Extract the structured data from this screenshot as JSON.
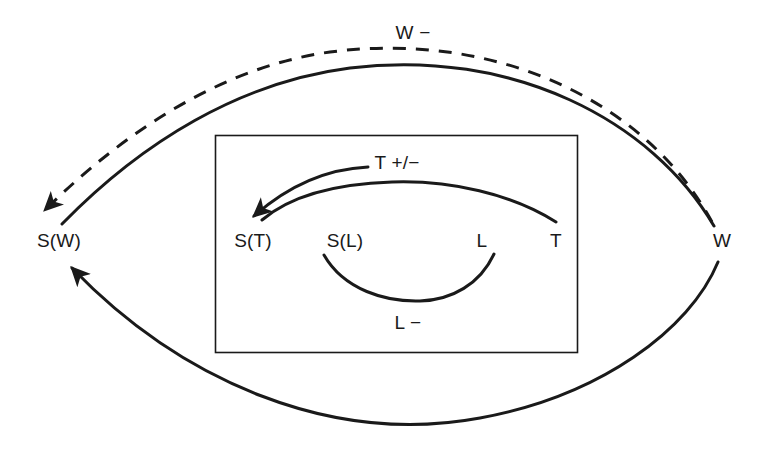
{
  "diagram": {
    "type": "causal-loop-diagram",
    "background_color": "#ffffff",
    "stroke_color": "#1a1a1a",
    "text_color": "#1a1a1a",
    "nodes": [
      {
        "id": "SW",
        "label": "S(W)",
        "x": 59,
        "y": 240,
        "region": "outer-left"
      },
      {
        "id": "W",
        "label": "W",
        "x": 722,
        "y": 240,
        "region": "outer-right"
      },
      {
        "id": "ST",
        "label": "S(T)",
        "x": 253,
        "y": 240,
        "region": "inner"
      },
      {
        "id": "SL",
        "label": "S(L)",
        "x": 345,
        "y": 240,
        "region": "inner"
      },
      {
        "id": "L",
        "label": "L",
        "x": 482,
        "y": 240,
        "region": "inner"
      },
      {
        "id": "T",
        "label": "T",
        "x": 556,
        "y": 240,
        "region": "inner"
      }
    ],
    "edge_labels": [
      {
        "id": "W-minus",
        "label": "W −",
        "x": 413,
        "y": 32
      },
      {
        "id": "T-plus-minus",
        "label": "T +/−",
        "x": 397,
        "y": 162
      },
      {
        "id": "L-minus",
        "label": "L −",
        "x": 408,
        "y": 322
      }
    ],
    "edges": [
      {
        "id": "w-to-sw-dashed",
        "from": "W",
        "to": "SW",
        "style": "dashed",
        "arrowhead": true,
        "label": "W −"
      },
      {
        "id": "sw-to-w-solid",
        "from": "SW",
        "to": "W",
        "style": "solid",
        "arrowhead": false,
        "label": ""
      },
      {
        "id": "w-to-sw-bottom",
        "from": "W",
        "to": "SW",
        "style": "solid",
        "arrowhead": true,
        "label": ""
      },
      {
        "id": "t-to-st-labelled",
        "from": "T",
        "to": "ST",
        "style": "solid",
        "arrowhead": true,
        "label": "T +/−"
      },
      {
        "id": "t-to-st-plain",
        "from": "T",
        "to": "ST",
        "style": "solid",
        "arrowhead": false,
        "label": ""
      },
      {
        "id": "sl-to-l-bottom",
        "from": "SL",
        "to": "L",
        "style": "solid",
        "arrowhead": false,
        "label": "L −"
      }
    ],
    "box": {
      "id": "inner-box",
      "x": 215,
      "y": 135,
      "width": 362,
      "height": 217
    }
  }
}
